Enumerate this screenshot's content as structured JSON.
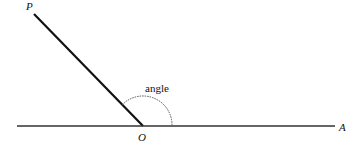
{
  "diagram": {
    "points": {
      "P": {
        "label": "P",
        "x": 34,
        "y": 14
      },
      "O": {
        "label": "O",
        "x": 143,
        "y": 126
      },
      "A": {
        "label": "A",
        "x": 335,
        "y": 126
      }
    },
    "angle_label": "angle",
    "colors": {
      "line": "#111111",
      "baseline": "#333333",
      "arc": "#555555"
    }
  }
}
